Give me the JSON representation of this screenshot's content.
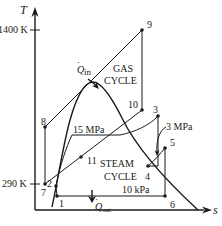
{
  "diagram": {
    "type": "T-s diagram, combined gas-steam power cycle",
    "axes": {
      "y_label": "T",
      "x_label": "s",
      "y_ticks": [
        {
          "label": "1400 K",
          "value": 1400
        },
        {
          "label": "290 K",
          "value": 290
        }
      ]
    },
    "cycles": {
      "gas": {
        "line1": "GAS",
        "line2": "CYCLE"
      },
      "steam": {
        "line1": "STEAM",
        "line2": "CYCLE"
      }
    },
    "heat": {
      "in": {
        "symbol": "Q",
        "sub": "in"
      },
      "out": {
        "symbol": "Q",
        "sub": "out"
      }
    },
    "pressures": {
      "high": "15 MPa",
      "mid": "3 MPa",
      "low": "10 kPa"
    },
    "points": {
      "p1": "1",
      "p2": "2",
      "p3": "3",
      "p4": "4",
      "p5": "5",
      "p6": "6",
      "p7": "7",
      "p8": "8",
      "p9": "9",
      "p10": "10",
      "p11": "11"
    }
  }
}
